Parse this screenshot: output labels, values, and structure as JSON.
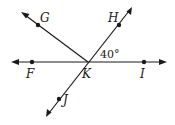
{
  "diagram": {
    "type": "intersecting-lines",
    "vertex": {
      "name": "K",
      "x": 88,
      "y": 62
    },
    "lines": [
      {
        "name": "line-FI",
        "from": [
          12,
          62
        ],
        "to": [
          166,
          62
        ],
        "points": [
          "F",
          "I"
        ]
      },
      {
        "name": "line-HJ",
        "from": [
          132,
          7
        ],
        "to": [
          46,
          117
        ],
        "points": [
          "H",
          "J"
        ]
      },
      {
        "name": "ray-KG",
        "from": [
          88,
          62
        ],
        "to": [
          21,
          12
        ],
        "points": [
          "G"
        ]
      }
    ],
    "points": [
      {
        "name": "G",
        "x": 38,
        "y": 25,
        "label_x": 43,
        "label_y": 21
      },
      {
        "name": "H",
        "x": 119,
        "y": 25,
        "label_x": 110,
        "label_y": 21
      },
      {
        "name": "F",
        "x": 32,
        "y": 62,
        "label_x": 28,
        "label_y": 77
      },
      {
        "name": "K",
        "x": 88,
        "y": 62,
        "label_x": 83,
        "label_y": 77
      },
      {
        "name": "I",
        "x": 144,
        "y": 62,
        "label_x": 141,
        "label_y": 77
      },
      {
        "name": "J",
        "x": 59,
        "y": 99,
        "label_x": 64,
        "label_y": 104
      }
    ],
    "angle_label": {
      "text": "40°",
      "between": [
        "H",
        "I"
      ],
      "x": 102,
      "y": 57
    },
    "colors": {
      "stroke": "#1a1a1a",
      "background": "#ffffff"
    }
  }
}
